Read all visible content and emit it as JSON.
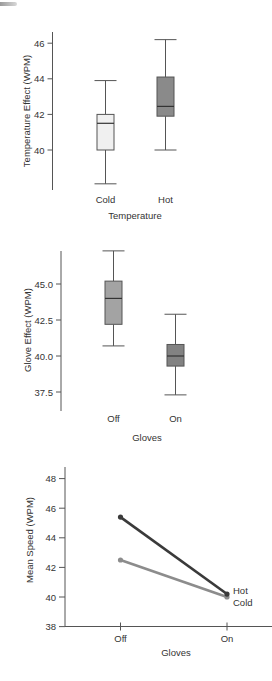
{
  "chart_data": [
    {
      "type": "box",
      "title": "",
      "xlabel": "Temperature",
      "ylabel": "Temperature Effect (WPM)",
      "categories": [
        "Cold",
        "Hot"
      ],
      "yticks": [
        40,
        42,
        44,
        46
      ],
      "ylim": [
        37.5,
        46.6
      ],
      "boxes": [
        {
          "name": "Cold",
          "whisker_low": 38.1,
          "q1": 40.0,
          "median": 41.5,
          "q3": 42.0,
          "whisker_high": 43.9,
          "fill": "#f0f0f0"
        },
        {
          "name": "Hot",
          "whisker_low": 40.0,
          "q1": 41.9,
          "median": 42.45,
          "q3": 44.1,
          "whisker_high": 46.2,
          "fill": "#8a8a8a"
        }
      ]
    },
    {
      "type": "box",
      "title": "",
      "xlabel": "Gloves",
      "ylabel": "Glove Effect (WPM)",
      "categories": [
        "Off",
        "On"
      ],
      "yticks": [
        "37.5",
        "40.0",
        "42.5",
        "45.0"
      ],
      "ylim": [
        36.2,
        47.5
      ],
      "boxes": [
        {
          "name": "Off",
          "whisker_low": 40.7,
          "q1": 42.2,
          "median": 44.0,
          "q3": 45.2,
          "whisker_high": 47.3,
          "fill": "#a3a3a3"
        },
        {
          "name": "On",
          "whisker_low": 37.3,
          "q1": 39.3,
          "median": 40.0,
          "q3": 40.8,
          "whisker_high": 42.9,
          "fill": "#828282"
        }
      ]
    },
    {
      "type": "line",
      "title": "",
      "xlabel": "Gloves",
      "ylabel": "Mean Speed (WPM)",
      "categories": [
        "Off",
        "On"
      ],
      "yticks": [
        38,
        40,
        42,
        44,
        46,
        48
      ],
      "ylim": [
        38,
        48.7
      ],
      "series": [
        {
          "name": "Hot",
          "values": [
            45.4,
            40.2
          ],
          "color": "#3a3a3a"
        },
        {
          "name": "Cold",
          "values": [
            42.5,
            40.0
          ],
          "color": "#8c8c8c"
        }
      ],
      "legend_position": "inline-right-end"
    }
  ]
}
